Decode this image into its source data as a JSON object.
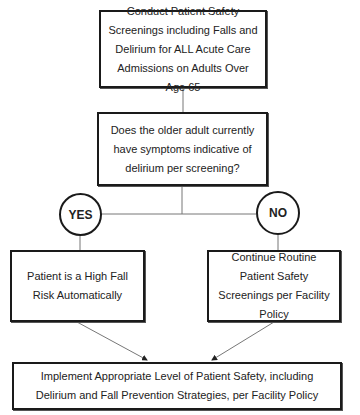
{
  "diagram": {
    "type": "flowchart",
    "nodes": {
      "start": "Conduct Patient Safety Screenings including Falls and Delirium for ALL Acute Care Admissions on Adults Over Age 65",
      "question": "Does the older adult currently have symptoms indicative of delirium per screening?",
      "yes_label": "YES",
      "no_label": "NO",
      "yes_outcome": "Patient is a High Fall Risk Automatically",
      "no_outcome": "Continue Routine Patient Safety Screenings per Facility Policy",
      "final": "Implement Appropriate Level of Patient Safety, including Delirium and Fall Prevention Strategies, per Facility Policy"
    },
    "edges": [
      {
        "from": "start",
        "to": "question"
      },
      {
        "from": "question",
        "to": "yes_label"
      },
      {
        "from": "question",
        "to": "no_label"
      },
      {
        "from": "yes_label",
        "to": "yes_outcome"
      },
      {
        "from": "no_label",
        "to": "no_outcome"
      },
      {
        "from": "yes_outcome",
        "to": "final",
        "arrow": true
      },
      {
        "from": "no_outcome",
        "to": "final",
        "arrow": true
      }
    ]
  }
}
